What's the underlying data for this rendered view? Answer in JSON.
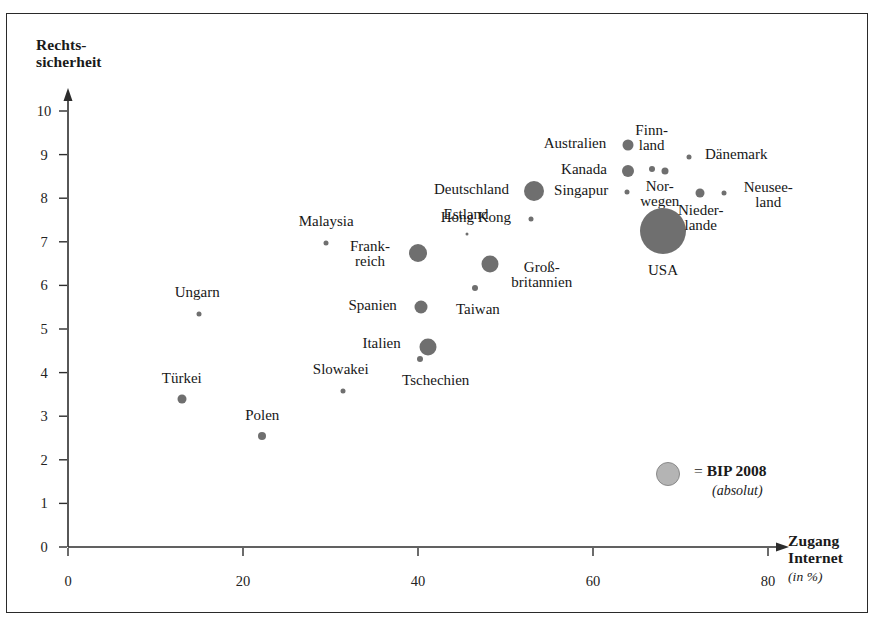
{
  "figure": {
    "width": 878,
    "height": 626,
    "background": "#ffffff",
    "frame_color": "#2a2a2a",
    "bubble_color": "#6f6f6f",
    "legend_bubble_color": "#b4b4b4"
  },
  "chart_data": {
    "type": "scatter",
    "title": "",
    "xlabel": "Zugang Internet",
    "xlabel_sub": "(in %)",
    "ylabel": "Rechts-",
    "ylabel_line2": "sicherheit",
    "xlim": [
      0,
      80
    ],
    "ylim": [
      0,
      10
    ],
    "xticks": [
      0,
      20,
      40,
      60,
      80
    ],
    "yticks": [
      0,
      1,
      2,
      3,
      4,
      5,
      6,
      7,
      8,
      9,
      10
    ],
    "xtick_labels": [
      "0",
      "20",
      "40",
      "60",
      "80"
    ],
    "ytick_labels": [
      "0",
      "1",
      "2",
      "3",
      "4",
      "5",
      "6",
      "7",
      "8",
      "9",
      "10"
    ],
    "grid": false,
    "legend": {
      "position": "inside-bottom-right",
      "marker_size_px": 24,
      "equals": "=",
      "label": "BIP 2008",
      "sublabel": "(absolut)"
    },
    "size_encoding": "BIP 2008 (absolut)",
    "points": [
      {
        "name": "Türkei",
        "x": 13.0,
        "y": 3.4,
        "size": 9,
        "label_dx": 0,
        "label_dy": -20,
        "label_lines": [
          "Türkei"
        ]
      },
      {
        "name": "Ungarn",
        "x": 15.0,
        "y": 5.35,
        "size": 5,
        "label_dx": -2,
        "label_dy": -21,
        "label_lines": [
          "Ungarn"
        ]
      },
      {
        "name": "Polen",
        "x": 22.2,
        "y": 2.55,
        "size": 8,
        "label_dx": 0,
        "label_dy": -20,
        "label_lines": [
          "Polen"
        ]
      },
      {
        "name": "Malaysia",
        "x": 29.5,
        "y": 6.98,
        "size": 5,
        "label_dx": 0,
        "label_dy": -21,
        "label_lines": [
          "Malaysia"
        ]
      },
      {
        "name": "Slowakei",
        "x": 31.4,
        "y": 3.58,
        "size": 5,
        "label_dx": -2,
        "label_dy": -21,
        "label_lines": [
          "Slowakei"
        ]
      },
      {
        "name": "Frankreich",
        "x": 40.0,
        "y": 6.75,
        "size": 18,
        "label_dx": -48,
        "label_dy": 2,
        "label_lines": [
          "Frank-",
          "reich"
        ]
      },
      {
        "name": "Spanien",
        "x": 40.3,
        "y": 5.5,
        "size": 13,
        "label_dx": -48,
        "label_dy": -1,
        "label_lines": [
          "Spanien"
        ]
      },
      {
        "name": "Tschechien",
        "x": 40.2,
        "y": 4.31,
        "size": 6,
        "label_dx": 16,
        "label_dy": 22,
        "label_lines": [
          "Tschechien"
        ]
      },
      {
        "name": "Italien",
        "x": 41.1,
        "y": 4.58,
        "size": 17,
        "label_dx": -46,
        "label_dy": -3,
        "label_lines": [
          "Italien"
        ]
      },
      {
        "name": "Estland",
        "x": 45.6,
        "y": 7.18,
        "size": 3,
        "label_dx": -1,
        "label_dy": -19,
        "label_lines": [
          "Estland"
        ]
      },
      {
        "name": "Taiwan",
        "x": 46.5,
        "y": 5.95,
        "size": 6,
        "label_dx": 3,
        "label_dy": 22,
        "label_lines": [
          "Taiwan"
        ]
      },
      {
        "name": "Großbritannien",
        "x": 48.2,
        "y": 6.5,
        "size": 17,
        "label_dx": 52,
        "label_dy": 12,
        "label_lines": [
          "Groß-",
          "britannien"
        ]
      },
      {
        "name": "Hong Kong",
        "x": 52.9,
        "y": 7.52,
        "size": 5,
        "label_dx": -55,
        "label_dy": -1,
        "label_lines": [
          "Hong Kong"
        ]
      },
      {
        "name": "Deutschland",
        "x": 53.2,
        "y": 8.17,
        "size": 20,
        "label_dx": -62,
        "label_dy": -1,
        "label_lines": [
          "Deutschland"
        ]
      },
      {
        "name": "Singapur",
        "x": 63.9,
        "y": 8.15,
        "size": 5,
        "label_dx": -46,
        "label_dy": -1,
        "label_lines": [
          "Singapur"
        ]
      },
      {
        "name": "Kanada",
        "x": 64.0,
        "y": 8.62,
        "size": 12,
        "label_dx": -44,
        "label_dy": -1,
        "label_lines": [
          "Kanada"
        ]
      },
      {
        "name": "Australien",
        "x": 64.0,
        "y": 9.23,
        "size": 11,
        "label_dx": -53,
        "label_dy": -1,
        "label_lines": [
          "Australien"
        ]
      },
      {
        "name": "Finnland",
        "x": 66.7,
        "y": 8.68,
        "size": 6,
        "label_dx": 0,
        "label_dy": -30,
        "label_lines": [
          "Finn-",
          "land"
        ]
      },
      {
        "name": "Norwegen",
        "x": 68.2,
        "y": 8.63,
        "size": 7,
        "label_dx": -5,
        "label_dy": 24,
        "label_lines": [
          "Nor-",
          "wegen"
        ]
      },
      {
        "name": "Dänemark",
        "x": 71.0,
        "y": 8.95,
        "size": 5,
        "label_dx": 47,
        "label_dy": -2,
        "label_lines": [
          "Dänemark"
        ]
      },
      {
        "name": "USA",
        "x": 68.0,
        "y": 7.25,
        "size": 46,
        "label_dx": 0,
        "label_dy": 40,
        "label_lines": [
          "USA"
        ]
      },
      {
        "name": "Niederlande",
        "x": 72.2,
        "y": 8.13,
        "size": 9,
        "label_dx": 1,
        "label_dy": 26,
        "label_lines": [
          "Nieder-",
          "lande"
        ]
      },
      {
        "name": "Neuseeland",
        "x": 75.0,
        "y": 8.13,
        "size": 5,
        "label_dx": 44,
        "label_dy": 3,
        "label_lines": [
          "Neusee-",
          "land"
        ]
      }
    ]
  }
}
